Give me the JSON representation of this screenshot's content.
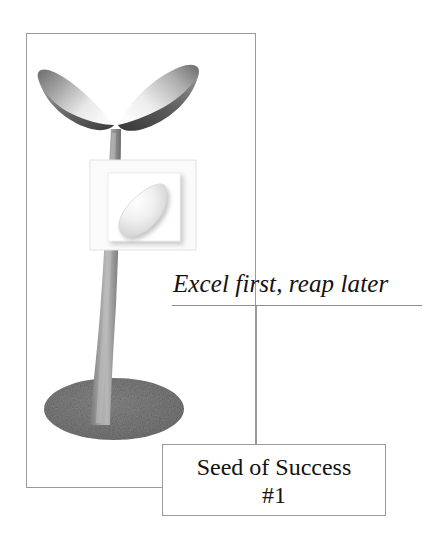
{
  "poster": {
    "width": 435,
    "height": 539,
    "background_color": "#ffffff"
  },
  "frame": {
    "name": "main-outline-frame",
    "border_color": "#9a9a9a"
  },
  "illustration": {
    "name": "seedling-illustration",
    "description": "Grayscale 3D seedling with two leaves, tapered stem, speckled soil mound, and a framed seed inset",
    "parts": {
      "left_leaf": "left-leaf",
      "right_leaf": "right-leaf",
      "stem": "stem",
      "soil": "soil-mound",
      "outer_panel": "seed-outer-panel",
      "inner_panel": "seed-inner-panel",
      "seed": "seed-shape"
    },
    "colors": {
      "leaf_dark": "#5f5f5f",
      "leaf_mid": "#9a9a9a",
      "leaf_light": "#f2f2f2",
      "stem": "#8d8d8d",
      "stem_light": "#b4b4b4",
      "soil": "#7e7e7e",
      "seed": "#ededed",
      "panel": "#fbfbfb",
      "panel_border": "#d8d8d8"
    }
  },
  "tagline": {
    "text": "Excel first, reap later",
    "rule_color": "#8e8e8e"
  },
  "connector": {
    "name": "connector-line",
    "color": "#9a9a9a"
  },
  "caption": {
    "line1": "Seed of Success",
    "line2": "#1",
    "border_color": "#9a9a9a"
  }
}
